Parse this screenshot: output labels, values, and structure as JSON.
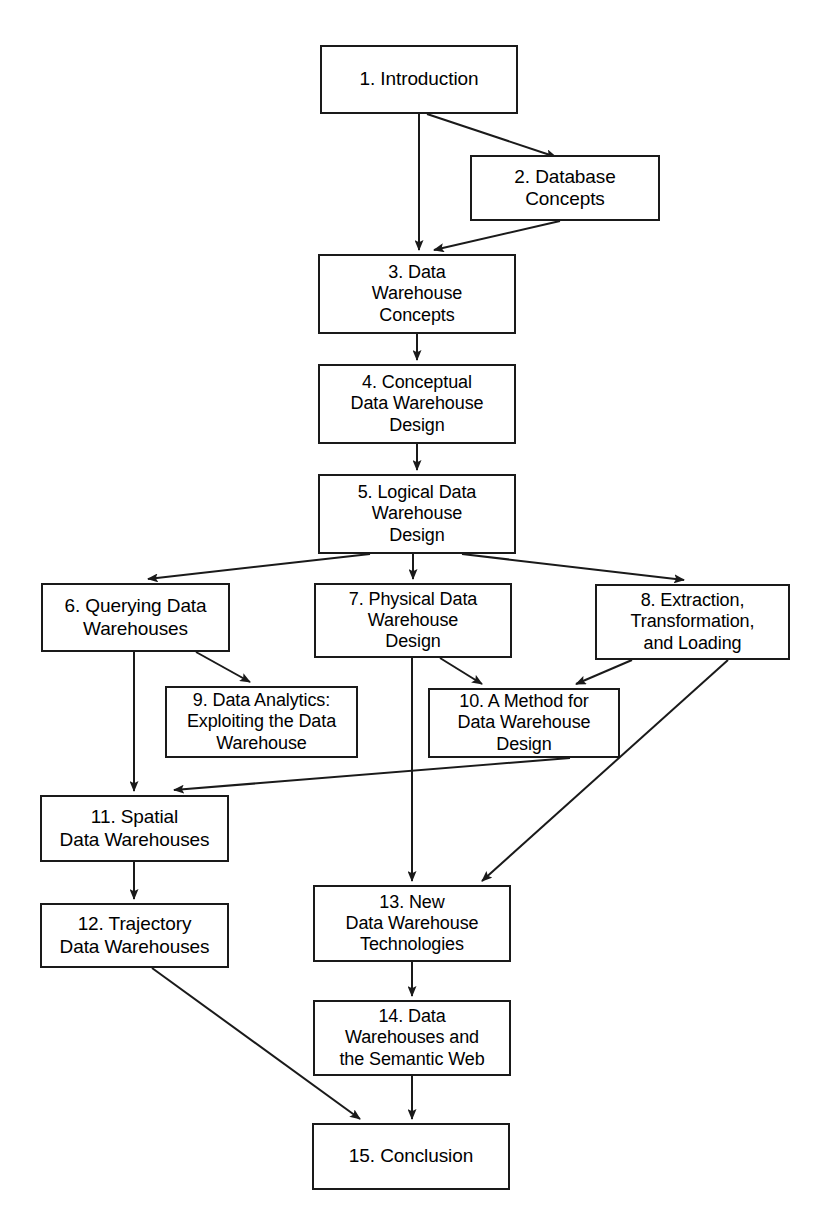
{
  "diagram": {
    "type": "flowchart",
    "orientation": "top-to-bottom",
    "background_color": "#ffffff",
    "line_color": "#1a1a1a",
    "box_border_color": "#1a1a1a",
    "box_fill_color": "#ffffff",
    "text_color": "#000000",
    "caption": "",
    "nodes": [
      {
        "id": "n1",
        "label": "1. Introduction",
        "x": 320,
        "y": 45,
        "w": 198,
        "h": 69
      },
      {
        "id": "n2",
        "label": "2. Database\nConcepts",
        "x": 470,
        "y": 155,
        "w": 190,
        "h": 66
      },
      {
        "id": "n3",
        "label": "3. Data\nWarehouse\nConcepts",
        "x": 318,
        "y": 254,
        "w": 198,
        "h": 80
      },
      {
        "id": "n4",
        "label": "4. Conceptual\nData Warehouse\nDesign",
        "x": 318,
        "y": 364,
        "w": 198,
        "h": 80
      },
      {
        "id": "n5",
        "label": "5. Logical Data\nWarehouse\nDesign",
        "x": 318,
        "y": 474,
        "w": 198,
        "h": 80
      },
      {
        "id": "n6",
        "label": "6. Querying Data\nWarehouses",
        "x": 41,
        "y": 583,
        "w": 189,
        "h": 69
      },
      {
        "id": "n7",
        "label": "7. Physical Data\nWarehouse\nDesign",
        "x": 314,
        "y": 583,
        "w": 198,
        "h": 75
      },
      {
        "id": "n8",
        "label": "8. Extraction,\nTransformation,\nand Loading",
        "x": 595,
        "y": 584,
        "w": 195,
        "h": 76
      },
      {
        "id": "n9",
        "label": "9. Data Analytics:\nExploiting the Data\nWarehouse",
        "x": 165,
        "y": 686,
        "w": 193,
        "h": 72
      },
      {
        "id": "n10",
        "label": "10. A Method for\nData Warehouse\nDesign",
        "x": 428,
        "y": 688,
        "w": 192,
        "h": 70
      },
      {
        "id": "n11",
        "label": "11. Spatial\nData Warehouses",
        "x": 40,
        "y": 795,
        "w": 189,
        "h": 67
      },
      {
        "id": "n12",
        "label": "12. Trajectory\nData Warehouses",
        "x": 40,
        "y": 903,
        "w": 189,
        "h": 65
      },
      {
        "id": "n13",
        "label": "13. New\nData Warehouse\nTechnologies",
        "x": 313,
        "y": 885,
        "w": 198,
        "h": 77
      },
      {
        "id": "n14",
        "label": "14. Data\nWarehouses and\nthe Semantic Web",
        "x": 313,
        "y": 1000,
        "w": 198,
        "h": 76
      },
      {
        "id": "n15",
        "label": "15. Conclusion",
        "x": 312,
        "y": 1123,
        "w": 198,
        "h": 67
      }
    ],
    "edges": [
      {
        "from": "n1",
        "to": "n2",
        "path": "M 427 114 L 556 157",
        "arrow_at": [
          556,
          157
        ]
      },
      {
        "from": "n1",
        "to": "n3",
        "path": "M 419 114 L 419 250",
        "arrow_at": [
          419,
          252
        ]
      },
      {
        "from": "n2",
        "to": "n3",
        "path": "M 560 221 L 434 250",
        "arrow_at": [
          432,
          251
        ]
      },
      {
        "from": "n3",
        "to": "n4",
        "path": "M 417 334 L 417 360",
        "arrow_at": [
          417,
          362
        ]
      },
      {
        "from": "n4",
        "to": "n5",
        "path": "M 417 444 L 417 470",
        "arrow_at": [
          417,
          472
        ]
      },
      {
        "from": "n5",
        "to": "n6",
        "path": "M 370 554 L 148 579",
        "arrow_at": [
          146,
          580
        ]
      },
      {
        "from": "n5",
        "to": "n7",
        "path": "M 413 554 L 413 579",
        "arrow_at": [
          413,
          581
        ]
      },
      {
        "from": "n5",
        "to": "n8",
        "path": "M 462 554 L 684 580",
        "arrow_at": [
          686,
          581
        ]
      },
      {
        "from": "n6",
        "to": "n9",
        "path": "M 196 652 L 250 682",
        "arrow_at": [
          252,
          683
        ]
      },
      {
        "from": "n6",
        "to": "n11",
        "path": "M 134 652 L 134 791",
        "arrow_at": [
          134,
          793
        ]
      },
      {
        "from": "n7",
        "to": "n10",
        "path": "M 440 658 L 482 684",
        "arrow_at": [
          484,
          685
        ]
      },
      {
        "from": "n7",
        "to": "n13",
        "path": "M 412 658 L 412 881",
        "arrow_at": [
          412,
          883
        ]
      },
      {
        "from": "n8",
        "to": "n10",
        "path": "M 632 660 L 576 684",
        "arrow_at": [
          574,
          685
        ]
      },
      {
        "from": "n8",
        "to": "n13",
        "path": "M 728 660 L 482 881",
        "arrow_at": [
          480,
          883
        ]
      },
      {
        "from": "n10",
        "to": "n11",
        "path": "M 570 758 L 174 790",
        "arrow_at": [
          172,
          790
        ]
      },
      {
        "from": "n11",
        "to": "n12",
        "path": "M 134 862 L 134 899",
        "arrow_at": [
          134,
          901
        ]
      },
      {
        "from": "n12",
        "to": "n15",
        "path": "M 152 968 L 360 1119",
        "arrow_at": [
          362,
          1121
        ]
      },
      {
        "from": "n13",
        "to": "n14",
        "path": "M 412 962 L 412 996",
        "arrow_at": [
          412,
          998
        ]
      },
      {
        "from": "n14",
        "to": "n15",
        "path": "M 412 1076 L 412 1119",
        "arrow_at": [
          412,
          1121
        ]
      }
    ]
  }
}
